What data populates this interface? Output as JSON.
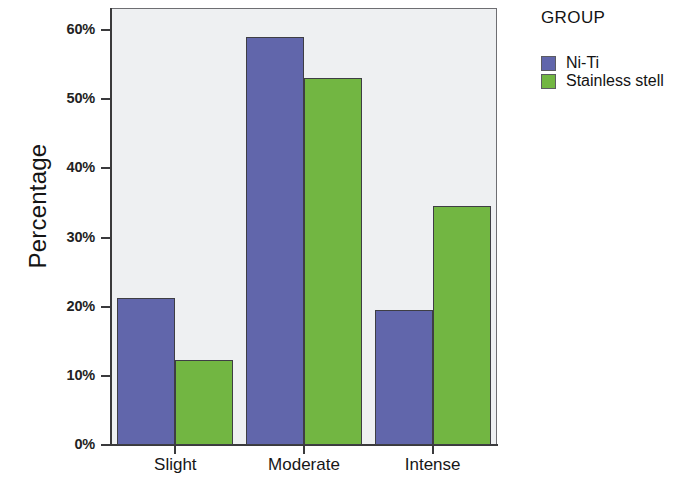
{
  "chart_data": {
    "type": "bar",
    "title": "",
    "xlabel": "",
    "ylabel": "Percentage",
    "categories": [
      "Slight",
      "Moderate",
      "Intense"
    ],
    "series": [
      {
        "name": "Ni-Ti",
        "color": "#6166ab",
        "values": [
          21.3,
          59.0,
          19.5
        ]
      },
      {
        "name": "Stainless stell",
        "color": "#72b642",
        "values": [
          12.3,
          53.0,
          34.5
        ]
      }
    ],
    "ylim": [
      0,
      63
    ],
    "yticks": [
      0,
      10,
      20,
      30,
      40,
      50,
      60
    ],
    "ytick_labels": [
      "0%",
      "10%",
      "20%",
      "30%",
      "40%",
      "50%",
      "60%"
    ],
    "grid": false,
    "legend_position": "right",
    "legend_title": "GROUP",
    "plot_background": "#eef0f2"
  }
}
